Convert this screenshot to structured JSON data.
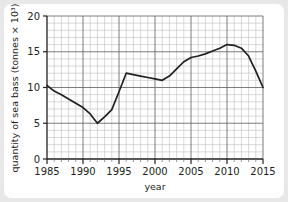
{
  "chart_data": {
    "type": "line",
    "title": "",
    "xlabel": "year",
    "ylabel": "quantity of sea bass (tonnes × 10³)",
    "xlim": [
      1985,
      2015
    ],
    "ylim": [
      0,
      20
    ],
    "x_major_ticks": [
      1985,
      1990,
      1995,
      2000,
      2005,
      2010,
      2015
    ],
    "x_major_tick_labels": [
      "1985",
      "1990",
      "1995",
      "2000",
      "2005",
      "2010",
      "2015"
    ],
    "y_major_ticks": [
      0,
      5,
      10,
      15,
      20
    ],
    "y_major_tick_labels": [
      "0",
      "5",
      "10",
      "15",
      "20"
    ],
    "x_minor_step": 1,
    "y_minor_step": 1,
    "grid": true,
    "grid_minor": true,
    "legend": false,
    "legend_position": "none",
    "line_color": "#231f20",
    "grid_major_color": "#6d6e71",
    "grid_minor_color": "#bcbec0",
    "background_color": "#ffffff",
    "page_background_color": "#e8e8e8",
    "x": [
      1985,
      1986,
      1987,
      1988,
      1989,
      1990,
      1991,
      1992,
      1993,
      1994,
      1995,
      1996,
      1997,
      1998,
      1999,
      2000,
      2001,
      2002,
      2003,
      2004,
      2005,
      2006,
      2007,
      2008,
      2009,
      2010,
      2011,
      2012,
      2013,
      2014,
      2015
    ],
    "values": [
      10.3,
      9.5,
      9.0,
      8.4,
      7.8,
      7.2,
      6.3,
      5.0,
      5.9,
      6.9,
      9.4,
      12.0,
      11.8,
      11.6,
      11.4,
      11.2,
      11.0,
      11.6,
      12.6,
      13.6,
      14.2,
      14.4,
      14.7,
      15.1,
      15.5,
      16.0,
      15.9,
      15.5,
      14.4,
      12.3,
      10.0
    ],
    "series": [
      {
        "name": "quantity of sea bass",
        "values": [
          10.3,
          9.5,
          9.0,
          8.4,
          7.8,
          7.2,
          6.3,
          5.0,
          5.9,
          6.9,
          9.4,
          12.0,
          11.8,
          11.6,
          11.4,
          11.2,
          11.0,
          11.6,
          12.6,
          13.6,
          14.2,
          14.4,
          14.7,
          15.1,
          15.5,
          16.0,
          15.9,
          15.5,
          14.4,
          12.3,
          10.0
        ]
      }
    ],
    "annotations": []
  }
}
